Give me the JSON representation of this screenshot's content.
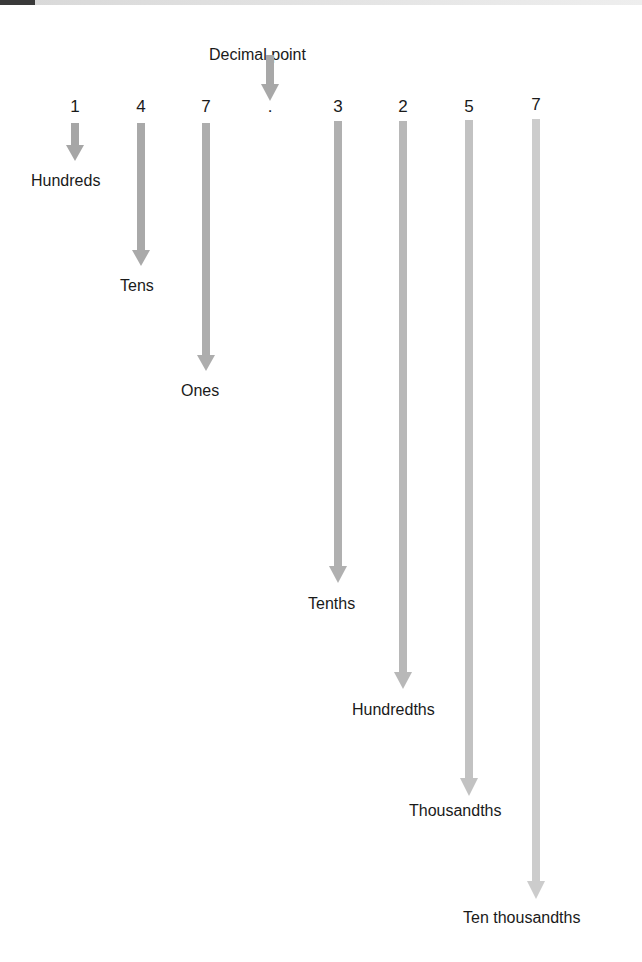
{
  "diagram": {
    "title_label": "Decimal point",
    "number": "147.3257",
    "decimal_point_symbol": ".",
    "places": [
      {
        "digit": "1",
        "name": "Hundreds",
        "color": "#a6a6a6"
      },
      {
        "digit": "4",
        "name": "Tens",
        "color": "#a9a9a9"
      },
      {
        "digit": "7",
        "name": "Ones",
        "color": "#adadad"
      },
      {
        "digit": "3",
        "name": "Tenths",
        "color": "#b0b0b0"
      },
      {
        "digit": "2",
        "name": "Hundredths",
        "color": "#b8b8b8"
      },
      {
        "digit": "5",
        "name": "Thousandths",
        "color": "#c2c2c2"
      },
      {
        "digit": "7",
        "name": "Ten thousandths",
        "color": "#cccccc"
      }
    ]
  }
}
